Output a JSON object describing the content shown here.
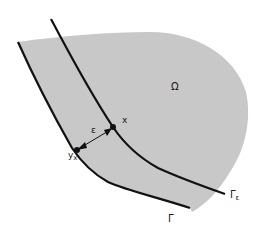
{
  "diagram": {
    "colors": {
      "region_fill": "#c8c8c8",
      "curve_stroke": "#111111",
      "background": "#ffffff"
    },
    "labels": {
      "omega": "Ω",
      "gamma_eps_main": "Γ",
      "gamma_eps_sub": "ε",
      "gamma": "Γ",
      "x": "x",
      "y_main": "y",
      "y_sub": "x",
      "epsilon": "ε"
    },
    "elements": {
      "region": "Ω",
      "outer_boundary": "Γ",
      "inner_curve": "Γε",
      "point_x": "x",
      "point_yx": "y_x",
      "distance_arrow": "ε"
    }
  }
}
